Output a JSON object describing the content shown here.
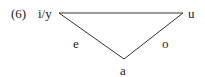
{
  "example": {
    "number": "(6)"
  },
  "vowels": {
    "top_left": "i/y",
    "top_right": "u",
    "mid_left": "e",
    "mid_right": "o",
    "bottom": "a"
  },
  "colors": {
    "line": "#333333",
    "text": "#222222",
    "background": "#ffffff"
  }
}
